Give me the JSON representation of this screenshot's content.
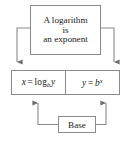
{
  "diagram": {
    "title": "A logarithm is an exponent",
    "type": "concept-relationship-diagram",
    "stroke_color": "#8a8a8a",
    "text_color": "#1a1a1a",
    "background_color": "#ffffff",
    "nodes": {
      "statement": {
        "name": "statement-box",
        "lines": [
          "A logarithm",
          "is",
          "an exponent"
        ]
      },
      "logarithmic_form": {
        "name": "logarithmic-form-box",
        "label": "x = log_b y",
        "lhs": "x",
        "operator": "=",
        "function": "log",
        "subscript": "b",
        "argument": "y"
      },
      "exponential_form": {
        "name": "exponential-form-box",
        "label": "y = b^x",
        "lhs": "y",
        "operator": "=",
        "base": "b",
        "superscript": "x"
      },
      "base": {
        "name": "base-box",
        "label": "Base"
      }
    },
    "connectors": [
      {
        "from": "statement",
        "to": "logarithmic_form",
        "direction": "down",
        "side": "left",
        "arrowhead": true
      },
      {
        "from": "statement",
        "to": "exponential_form",
        "direction": "down",
        "side": "right",
        "arrowhead": true
      },
      {
        "from": "base",
        "to": "logarithmic_form",
        "direction": "up",
        "side": "left",
        "arrowhead": true
      },
      {
        "from": "base",
        "to": "exponential_form",
        "direction": "up",
        "side": "right",
        "arrowhead": true
      }
    ]
  }
}
